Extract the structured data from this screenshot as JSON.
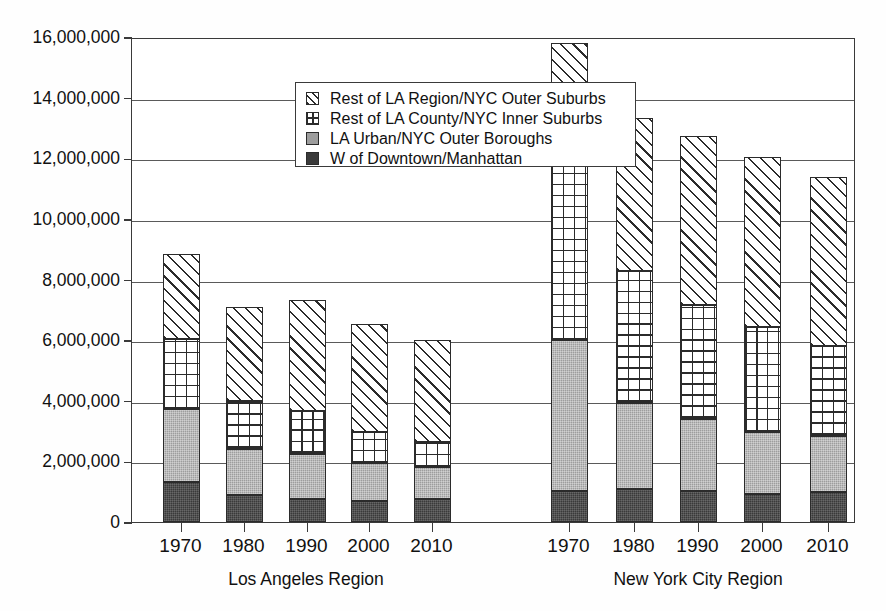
{
  "chart_data": {
    "type": "bar",
    "subtype": "stacked-bar-grouped",
    "title": "",
    "xlabel": "",
    "ylabel": "",
    "ylim": [
      0,
      16000000
    ],
    "ytick_values": [
      0,
      2000000,
      4000000,
      6000000,
      8000000,
      10000000,
      12000000,
      14000000,
      16000000
    ],
    "ytick_labels": [
      "0",
      "2,000,000",
      "4,000,000",
      "6,000,000",
      "8,000,000",
      "10,000,000",
      "12,000,000",
      "14,000,000",
      "16,000,000"
    ],
    "grid": true,
    "grid_axis": "y",
    "legend_position": "upper-left-inside",
    "categories": [
      "1970",
      "1980",
      "1990",
      "2000",
      "2010"
    ],
    "groups": [
      {
        "name": "Los Angeles Region",
        "categories": [
          "1970",
          "1980",
          "1990",
          "2000",
          "2010"
        ],
        "series": [
          {
            "name": "W of Downtown/Manhattan",
            "pattern": "solid-dark",
            "values": [
              1320000,
              890000,
              760000,
              690000,
              760000
            ]
          },
          {
            "name": "LA Urban/NYC Outer Boroughs",
            "pattern": "solid-gray",
            "values": [
              2410000,
              1520000,
              1490000,
              1250000,
              1060000
            ]
          },
          {
            "name": "Rest of LA County/NYC Inner Suburbs",
            "pattern": "crosshatch",
            "values": [
              2310000,
              1580000,
              1420000,
              1020000,
              830000
            ]
          },
          {
            "name": "Rest of LA Region/NYC Outer Suburbs",
            "pattern": "diagonal",
            "values": [
              2810000,
              3100000,
              3670000,
              3570000,
              3370000
            ]
          }
        ],
        "totals": [
          8850000,
          7090000,
          7340000,
          6530000,
          6020000
        ]
      },
      {
        "name": "New York City Region",
        "categories": [
          "1970",
          "1980",
          "1990",
          "2000",
          "2010"
        ],
        "series": [
          {
            "name": "W of Downtown/Manhattan",
            "pattern": "solid-dark",
            "values": [
              1020000,
              1090000,
              1020000,
              920000,
              990000
            ]
          },
          {
            "name": "LA Urban/NYC Outer Boroughs",
            "pattern": "solid-gray",
            "values": [
              4980000,
              2840000,
              2380000,
              2050000,
              1850000
            ]
          },
          {
            "name": "Rest of LA County/NYC Inner Suburbs",
            "pattern": "crosshatch",
            "values": [
              5970000,
              4360000,
              3760000,
              3470000,
              2970000
            ]
          },
          {
            "name": "Rest of LA Region/NYC Outer Suburbs",
            "pattern": "diagonal",
            "values": [
              3830000,
              5050000,
              5580000,
              5610000,
              5580000
            ]
          }
        ],
        "totals": [
          15800000,
          13340000,
          12740000,
          12050000,
          11390000
        ]
      }
    ],
    "legend": [
      {
        "label": "Rest of LA Region/NYC Outer Suburbs",
        "pattern": "diagonal"
      },
      {
        "label": "Rest of LA County/NYC Inner Suburbs",
        "pattern": "crosshatch"
      },
      {
        "label": "LA Urban/NYC Outer Boroughs",
        "pattern": "solid-gray"
      },
      {
        "label": "W of Downtown/Manhattan",
        "pattern": "solid-dark"
      }
    ],
    "colors": {
      "solid_dark": "#3a3a3a",
      "solid_gray": "#9d9d9d",
      "hatch_line": "#2b2b2b",
      "background": "#ffffff",
      "axis": "#3a3a3a"
    }
  }
}
